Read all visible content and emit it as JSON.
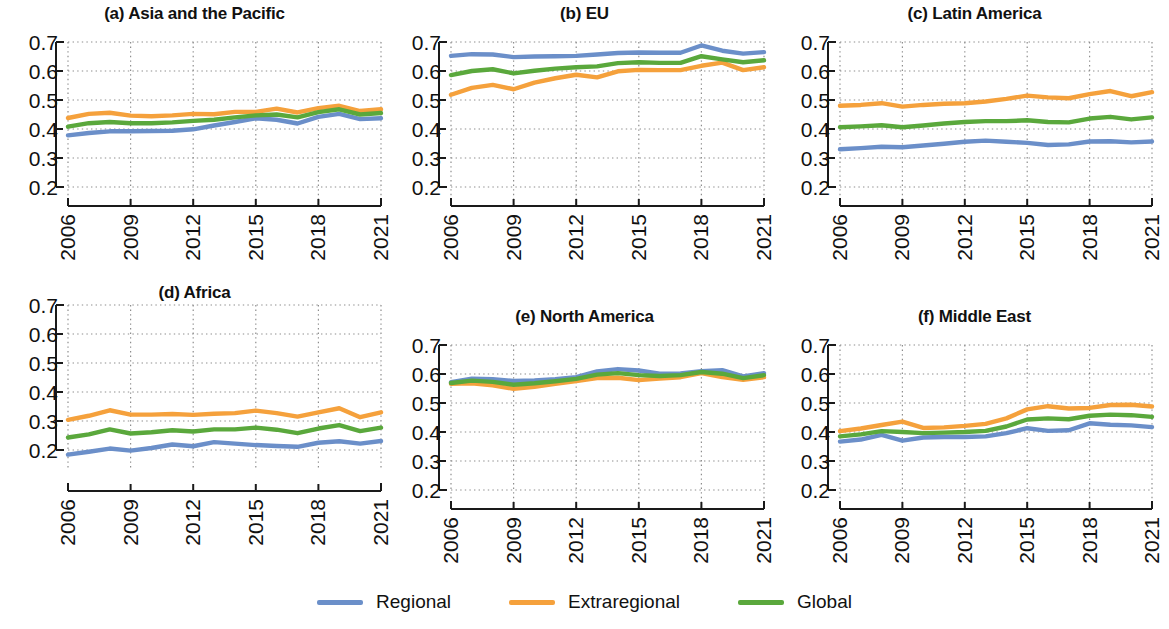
{
  "figure": {
    "legend": [
      {
        "key": "regional",
        "label": "Regional",
        "color": "#6b8fc9"
      },
      {
        "key": "extraregional",
        "label": "Extraregional",
        "color": "#f5a13c"
      },
      {
        "key": "global",
        "label": "Global",
        "color": "#5aa83c"
      }
    ]
  },
  "chart_data": [
    {
      "type": "line",
      "title": "(a) Asia and the Pacific",
      "xlabel": "",
      "ylabel": "",
      "x": [
        2006,
        2007,
        2008,
        2009,
        2010,
        2011,
        2012,
        2013,
        2014,
        2015,
        2016,
        2017,
        2018,
        2019,
        2020,
        2021
      ],
      "xticks": [
        2006,
        2009,
        2012,
        2015,
        2018,
        2021
      ],
      "yticks": [
        0.2,
        0.3,
        0.4,
        0.5,
        0.6,
        0.7
      ],
      "ylim": [
        0.2,
        0.7
      ],
      "grid": true,
      "legend_position": "bottom",
      "series": [
        {
          "name": "Regional",
          "values": [
            0.378,
            0.386,
            0.392,
            0.392,
            0.393,
            0.394,
            0.399,
            0.412,
            0.424,
            0.437,
            0.432,
            0.419,
            0.442,
            0.452,
            0.434,
            0.437
          ]
        },
        {
          "name": "Extraregional",
          "values": [
            0.438,
            0.452,
            0.456,
            0.446,
            0.444,
            0.447,
            0.452,
            0.451,
            0.459,
            0.459,
            0.47,
            0.457,
            0.472,
            0.48,
            0.462,
            0.468
          ]
        },
        {
          "name": "Global",
          "values": [
            0.408,
            0.42,
            0.424,
            0.42,
            0.42,
            0.423,
            0.428,
            0.432,
            0.44,
            0.447,
            0.45,
            0.44,
            0.458,
            0.468,
            0.45,
            0.455
          ]
        }
      ]
    },
    {
      "type": "line",
      "title": "(b) EU",
      "xlabel": "",
      "ylabel": "",
      "x": [
        2006,
        2007,
        2008,
        2009,
        2010,
        2011,
        2012,
        2013,
        2014,
        2015,
        2016,
        2017,
        2018,
        2019,
        2020,
        2021
      ],
      "xticks": [
        2006,
        2009,
        2012,
        2015,
        2018,
        2021
      ],
      "yticks": [
        0.2,
        0.3,
        0.4,
        0.5,
        0.6,
        0.7
      ],
      "ylim": [
        0.2,
        0.7
      ],
      "grid": true,
      "legend_position": "bottom",
      "series": [
        {
          "name": "Regional",
          "values": [
            0.652,
            0.658,
            0.657,
            0.648,
            0.65,
            0.651,
            0.652,
            0.657,
            0.662,
            0.664,
            0.663,
            0.663,
            0.688,
            0.67,
            0.66,
            0.665
          ]
        },
        {
          "name": "Extraregional",
          "values": [
            0.518,
            0.542,
            0.552,
            0.537,
            0.56,
            0.575,
            0.587,
            0.578,
            0.599,
            0.604,
            0.603,
            0.603,
            0.618,
            0.629,
            0.603,
            0.613
          ]
        },
        {
          "name": "Global",
          "values": [
            0.586,
            0.6,
            0.606,
            0.592,
            0.601,
            0.608,
            0.613,
            0.616,
            0.627,
            0.63,
            0.628,
            0.628,
            0.651,
            0.64,
            0.63,
            0.637
          ]
        }
      ]
    },
    {
      "type": "line",
      "title": "(c) Latin America",
      "xlabel": "",
      "ylabel": "",
      "x": [
        2006,
        2007,
        2008,
        2009,
        2010,
        2011,
        2012,
        2013,
        2014,
        2015,
        2016,
        2017,
        2018,
        2019,
        2020,
        2021
      ],
      "xticks": [
        2006,
        2009,
        2012,
        2015,
        2018,
        2021
      ],
      "yticks": [
        0.2,
        0.3,
        0.4,
        0.5,
        0.6,
        0.7
      ],
      "ylim": [
        0.2,
        0.7
      ],
      "grid": true,
      "legend_position": "bottom",
      "series": [
        {
          "name": "Regional",
          "values": [
            0.33,
            0.334,
            0.339,
            0.337,
            0.343,
            0.349,
            0.356,
            0.36,
            0.356,
            0.352,
            0.345,
            0.347,
            0.357,
            0.358,
            0.354,
            0.357
          ]
        },
        {
          "name": "Extraregional",
          "values": [
            0.48,
            0.483,
            0.489,
            0.477,
            0.483,
            0.487,
            0.489,
            0.495,
            0.504,
            0.515,
            0.509,
            0.506,
            0.52,
            0.531,
            0.513,
            0.527
          ]
        },
        {
          "name": "Global",
          "values": [
            0.406,
            0.409,
            0.413,
            0.406,
            0.412,
            0.419,
            0.424,
            0.427,
            0.427,
            0.43,
            0.424,
            0.423,
            0.436,
            0.442,
            0.433,
            0.44
          ]
        }
      ]
    },
    {
      "type": "line",
      "title": "(d) Africa",
      "xlabel": "",
      "ylabel": "",
      "x": [
        2006,
        2007,
        2008,
        2009,
        2010,
        2011,
        2012,
        2013,
        2014,
        2015,
        2016,
        2017,
        2018,
        2019,
        2020,
        2021
      ],
      "xticks": [
        2006,
        2009,
        2012,
        2015,
        2018,
        2021
      ],
      "yticks": [
        0.2,
        0.3,
        0.4,
        0.5,
        0.6,
        0.7
      ],
      "ylim": [
        0.2,
        0.7
      ],
      "grid": true,
      "legend_position": "bottom",
      "series": [
        {
          "name": "Regional",
          "values": [
            0.184,
            0.194,
            0.205,
            0.198,
            0.207,
            0.219,
            0.213,
            0.227,
            0.222,
            0.217,
            0.214,
            0.211,
            0.225,
            0.23,
            0.222,
            0.231
          ]
        },
        {
          "name": "Extraregional",
          "values": [
            0.304,
            0.318,
            0.337,
            0.322,
            0.322,
            0.324,
            0.321,
            0.325,
            0.327,
            0.336,
            0.327,
            0.315,
            0.33,
            0.344,
            0.313,
            0.33
          ]
        },
        {
          "name": "Global",
          "values": [
            0.243,
            0.254,
            0.271,
            0.257,
            0.261,
            0.268,
            0.264,
            0.271,
            0.271,
            0.277,
            0.27,
            0.258,
            0.274,
            0.286,
            0.265,
            0.277
          ]
        }
      ]
    },
    {
      "type": "line",
      "title": "(e) North America",
      "xlabel": "",
      "ylabel": "",
      "x": [
        2006,
        2007,
        2008,
        2009,
        2010,
        2011,
        2012,
        2013,
        2014,
        2015,
        2016,
        2017,
        2018,
        2019,
        2020,
        2021
      ],
      "xticks": [
        2006,
        2009,
        2012,
        2015,
        2018,
        2021
      ],
      "yticks": [
        0.2,
        0.3,
        0.4,
        0.5,
        0.6,
        0.7
      ],
      "ylim": [
        0.2,
        0.7
      ],
      "grid": true,
      "legend_position": "bottom",
      "series": [
        {
          "name": "Regional",
          "values": [
            0.572,
            0.584,
            0.582,
            0.576,
            0.578,
            0.582,
            0.589,
            0.609,
            0.617,
            0.612,
            0.601,
            0.602,
            0.61,
            0.613,
            0.592,
            0.603
          ]
        },
        {
          "name": "Extraregional",
          "values": [
            0.566,
            0.568,
            0.561,
            0.549,
            0.556,
            0.566,
            0.576,
            0.586,
            0.587,
            0.579,
            0.584,
            0.589,
            0.603,
            0.589,
            0.58,
            0.589
          ]
        },
        {
          "name": "Global",
          "values": [
            0.569,
            0.577,
            0.573,
            0.563,
            0.568,
            0.575,
            0.583,
            0.598,
            0.603,
            0.596,
            0.593,
            0.596,
            0.607,
            0.601,
            0.586,
            0.596
          ]
        }
      ]
    },
    {
      "type": "line",
      "title": "(f) Middle East",
      "xlabel": "",
      "ylabel": "",
      "x": [
        2006,
        2007,
        2008,
        2009,
        2010,
        2011,
        2012,
        2013,
        2014,
        2015,
        2016,
        2017,
        2018,
        2019,
        2020,
        2021
      ],
      "xticks": [
        2006,
        2009,
        2012,
        2015,
        2018,
        2021
      ],
      "yticks": [
        0.2,
        0.3,
        0.4,
        0.5,
        0.6,
        0.7
      ],
      "ylim": [
        0.2,
        0.7
      ],
      "grid": true,
      "legend_position": "bottom",
      "series": [
        {
          "name": "Regional",
          "values": [
            0.367,
            0.374,
            0.39,
            0.37,
            0.381,
            0.383,
            0.383,
            0.385,
            0.396,
            0.413,
            0.404,
            0.406,
            0.43,
            0.425,
            0.423,
            0.417
          ]
        },
        {
          "name": "Extraregional",
          "values": [
            0.403,
            0.412,
            0.424,
            0.436,
            0.414,
            0.416,
            0.421,
            0.428,
            0.447,
            0.478,
            0.489,
            0.481,
            0.483,
            0.493,
            0.494,
            0.488
          ]
        },
        {
          "name": "Global",
          "values": [
            0.385,
            0.392,
            0.403,
            0.4,
            0.396,
            0.398,
            0.4,
            0.404,
            0.419,
            0.443,
            0.447,
            0.444,
            0.456,
            0.46,
            0.458,
            0.452
          ]
        }
      ]
    }
  ]
}
